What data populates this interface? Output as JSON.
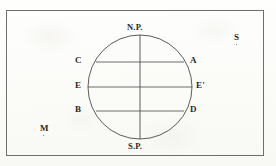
{
  "figure": {
    "type": "line-diagram",
    "background_color": "#fdfdfb",
    "ink_color": "#3a3a3a",
    "frame": {
      "name": "border-rectangle",
      "x": 6,
      "y": 10,
      "width": 258,
      "height": 146,
      "stroke": "#6e6e6e"
    },
    "circle": {
      "name": "sphere-outline",
      "center_x": 140,
      "center_y": 87,
      "radius": 52,
      "stroke": "#4a4a4a"
    },
    "axis": {
      "name": "polar-axis",
      "x": 140,
      "y_top": 35,
      "y_bottom": 139
    },
    "chords": [
      {
        "name": "chord-CA",
        "y": 62,
        "x_left": 96,
        "x_right": 184
      },
      {
        "name": "chord-EE-prime",
        "y": 87,
        "x_left": 88,
        "x_right": 192
      },
      {
        "name": "chord-BD",
        "y": 111,
        "x_left": 96,
        "x_right": 184
      }
    ],
    "labels": {
      "north_pole": "N.P.",
      "south_pole": "S.P.",
      "left_upper": "C",
      "left_middle": "E",
      "left_lower": "B",
      "right_upper": "A",
      "right_middle": "E'",
      "right_lower": "D",
      "corner_upper_right": "S",
      "corner_lower_left": "M"
    }
  }
}
